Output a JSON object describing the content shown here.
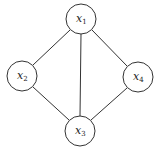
{
  "diagram": {
    "type": "undirected-graph",
    "nodes": [
      {
        "id": "x1",
        "label": "x",
        "sub": "1",
        "cx": 81,
        "cy": 19,
        "r": 15
      },
      {
        "id": "x2",
        "label": "x",
        "sub": "2",
        "cx": 22,
        "cy": 76,
        "r": 15
      },
      {
        "id": "x3",
        "label": "x",
        "sub": "3",
        "cx": 80,
        "cy": 131,
        "r": 15
      },
      {
        "id": "x4",
        "label": "x",
        "sub": "4",
        "cx": 138,
        "cy": 77,
        "r": 15
      }
    ],
    "edges": [
      [
        "x1",
        "x2"
      ],
      [
        "x1",
        "x3"
      ],
      [
        "x1",
        "x4"
      ],
      [
        "x2",
        "x3"
      ],
      [
        "x4",
        "x3"
      ]
    ]
  }
}
